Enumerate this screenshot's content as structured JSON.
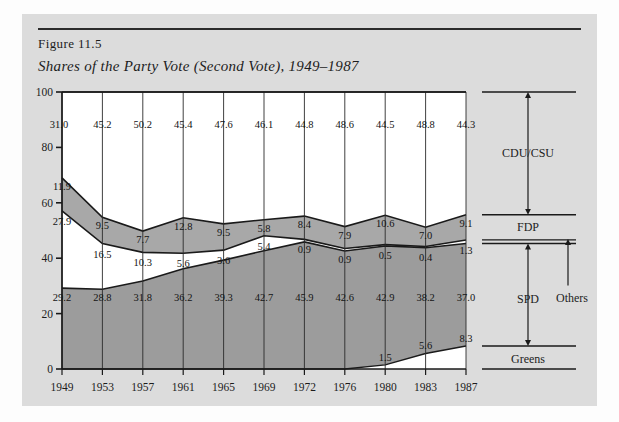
{
  "figure": {
    "number": "Figure 11.5",
    "title": "Shares of the Party Vote (Second Vote), 1949–1987"
  },
  "legend": {
    "cdu": "CDU/CSU",
    "fdp": "FDP",
    "others": "Others",
    "spd": "SPD",
    "greens": "Greens"
  },
  "colors": {
    "figure_background": "#dcdcdc",
    "page_background": "#fdfdfd",
    "band_light": "#ffffff",
    "band_fdp": "#a8a8a8",
    "band_spd": "#9c9c9c",
    "line": "#1a1a1a",
    "text": "#1c1c1c"
  },
  "chart_data": {
    "type": "area",
    "title": "Shares of the Party Vote (Second Vote), 1949–1987",
    "xlabel": "",
    "ylabel": "",
    "ylim": [
      0,
      100
    ],
    "yticks": [
      0,
      20,
      40,
      60,
      80,
      100
    ],
    "grid": true,
    "legend_position": "right",
    "stack_order_bottom_to_top": [
      "Greens",
      "SPD",
      "Others",
      "FDP",
      "CDU/CSU"
    ],
    "categories": [
      "1949",
      "1953",
      "1957",
      "1961",
      "1965",
      "1969",
      "1972",
      "1976",
      "1980",
      "1983",
      "1987"
    ],
    "series": [
      {
        "name": "CDU/CSU",
        "values": [
          31.0,
          45.2,
          50.2,
          45.4,
          47.6,
          46.1,
          44.8,
          48.6,
          44.5,
          48.8,
          44.3
        ]
      },
      {
        "name": "FDP",
        "values": [
          11.9,
          9.5,
          7.7,
          12.8,
          9.5,
          5.8,
          8.4,
          7.9,
          10.6,
          7.0,
          9.1
        ]
      },
      {
        "name": "Others",
        "values": [
          27.9,
          16.5,
          10.3,
          5.6,
          3.6,
          5.4,
          0.9,
          0.9,
          0.5,
          0.4,
          1.3
        ]
      },
      {
        "name": "SPD",
        "values": [
          29.2,
          28.8,
          31.8,
          36.2,
          39.3,
          42.7,
          45.9,
          42.6,
          42.9,
          38.2,
          37.0
        ]
      },
      {
        "name": "Greens",
        "values": [
          0,
          0,
          0,
          0,
          0,
          0,
          0,
          0,
          1.5,
          5.6,
          8.3
        ]
      }
    ],
    "yticklabels": [
      "0",
      "20",
      "40",
      "60",
      "80",
      "100"
    ],
    "xticklabels": [
      "1949",
      "1953",
      "1957",
      "1961",
      "1965",
      "1969",
      "1972",
      "1976",
      "1980",
      "1983",
      "1987"
    ]
  }
}
